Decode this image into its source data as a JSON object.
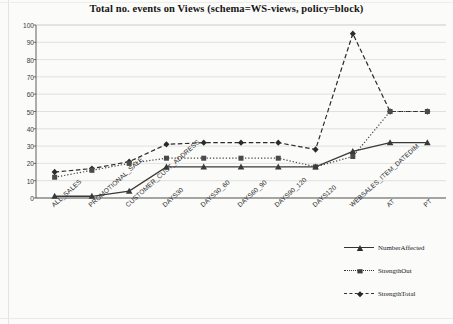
{
  "chart_data": {
    "type": "line",
    "title": "Total no. events on Views (schema=WS-views, policy=block)",
    "xlabel": "",
    "ylabel": "",
    "ylim": [
      0,
      100
    ],
    "ytick_step": 10,
    "grid": true,
    "legend_position": "bottom-right",
    "categories": [
      "ALL_SALES",
      "PROMOTIONAL_SALE",
      "CUSTOMER_CUST_ADDRESS",
      "DAYS30",
      "DAYS30_60",
      "DAYS60_90",
      "DAYS90_120",
      "DAYS120",
      "WEBSALES_ITEM_DATEDIM",
      "AT",
      "PT"
    ],
    "yticks": [
      "0",
      "10",
      "20",
      "30",
      "40",
      "50",
      "60",
      "70",
      "80",
      "90",
      "100"
    ],
    "series": [
      {
        "name": "NumberAffected",
        "marker": "triangle",
        "line_style": "solid",
        "color": "#3a3a3a",
        "values": [
          1,
          1,
          4,
          18,
          18,
          18,
          18,
          18,
          27,
          32,
          32
        ]
      },
      {
        "name": "StrengthOut",
        "marker": "square",
        "line_style": "dotted",
        "color": "#4a4a4a",
        "values": [
          12,
          16,
          20,
          23,
          23,
          23,
          23,
          18,
          24,
          50,
          50
        ]
      },
      {
        "name": "StrengthTotal",
        "marker": "diamond",
        "line_style": "dashed",
        "color": "#2b2b2b",
        "values": [
          15,
          17,
          21,
          31,
          32,
          32,
          32,
          28,
          95,
          50,
          50
        ]
      }
    ]
  },
  "legend": {
    "items": [
      {
        "label": "NumberAffected"
      },
      {
        "label": "StrengthOut"
      },
      {
        "label": "StrengthTotal"
      }
    ]
  },
  "colors": {
    "axis": "#4d4d4d",
    "grid": "#cfcfcf",
    "text": "#1a1a1a",
    "background": "#fbfbfa"
  }
}
